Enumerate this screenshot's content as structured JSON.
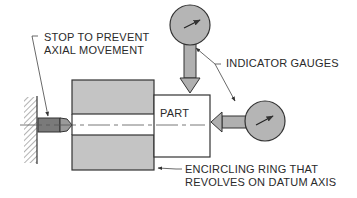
{
  "diagram": {
    "labels": {
      "stop_line1": "STOP TO PREVENT",
      "stop_line2": "AXIAL MOVEMENT",
      "indicator": "INDICATOR GAUGES",
      "part": "PART",
      "ring_line1": "ENCIRCLING RING THAT",
      "ring_line2": "REVOLVES ON DATUM AXIS"
    },
    "colors": {
      "fill_gray": "#c4c4c4",
      "dark_gray": "#7a7a7a",
      "stroke": "#333333",
      "background": "#ffffff"
    }
  }
}
